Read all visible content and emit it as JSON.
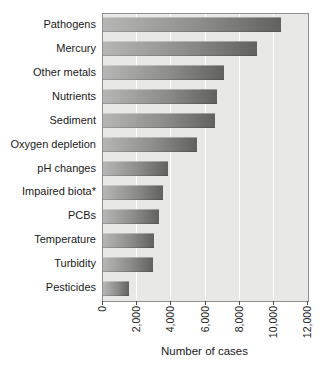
{
  "chart_data": {
    "type": "bar",
    "orientation": "horizontal",
    "title": "",
    "xlabel": "Number of cases",
    "ylabel": "",
    "xlim": [
      0,
      12000
    ],
    "grid": "vertical",
    "categories": [
      "Pathogens",
      "Mercury",
      "Other metals",
      "Nutrients",
      "Sediment",
      "Oxygen depletion",
      "pH changes",
      "Impaired biota*",
      "PCBs",
      "Temperature",
      "Turbidity",
      "Pesticides"
    ],
    "values": [
      10400,
      9000,
      7100,
      6700,
      6550,
      5500,
      3800,
      3500,
      3300,
      3000,
      2900,
      1550
    ],
    "x_ticks": [
      0,
      2000,
      4000,
      6000,
      8000,
      10000,
      12000
    ],
    "x_tick_labels": [
      "0",
      "2,000",
      "4,000",
      "6,000",
      "8,000",
      "10,000",
      "12,000"
    ],
    "colors": {
      "plot_background": "#e8e8e6",
      "bar_gradient_start": "#b6b6b4",
      "bar_gradient_end": "#61615e",
      "gridline": "#ffffff",
      "plot_border": "#8f8f8f",
      "text": "#1a1a1a"
    }
  }
}
